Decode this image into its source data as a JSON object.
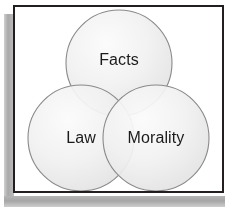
{
  "diagram": {
    "type": "venn",
    "set_count": 3,
    "title": "",
    "background_color": "#ffffff",
    "frame_border_color": "#231f20",
    "shadow_color": "#a9a9a9",
    "circle_fill_color": "#f0f0f0",
    "circle_overlap_color": "#dcdcdc",
    "circle_stroke_color": "#8a8a8a",
    "label_color": "#1b1b1b",
    "sets": [
      {
        "id": "facts",
        "label": "Facts",
        "position": "top",
        "center_x": 104,
        "center_y": 56,
        "radius": 53
      },
      {
        "id": "law",
        "label": "Law",
        "position": "bottom-left",
        "center_x": 66,
        "center_y": 131,
        "radius": 53
      },
      {
        "id": "morality",
        "label": "Morality",
        "position": "bottom-right",
        "center_x": 141,
        "center_y": 131,
        "radius": 53
      }
    ]
  }
}
